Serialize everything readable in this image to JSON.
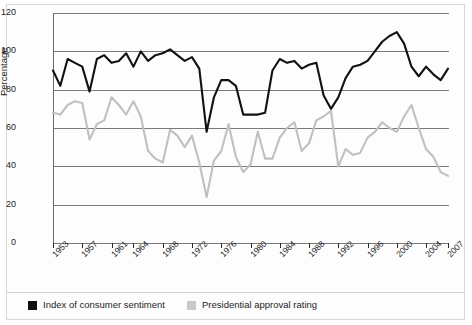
{
  "chart_data": {
    "type": "line",
    "title": "",
    "xlabel": "",
    "ylabel": "Percentage",
    "ylim": [
      0,
      120
    ],
    "ytick_step": 20,
    "ytick_labels": [
      "0",
      "20",
      "40",
      "60",
      "80",
      "100",
      "120"
    ],
    "grid": true,
    "legend_position": "bottom",
    "xtick_labels": [
      "1953",
      "1957",
      "1961",
      "1964",
      "1968",
      "1972",
      "1976",
      "1980",
      "1984",
      "1988",
      "1992",
      "1996",
      "2000",
      "2004",
      "2007"
    ],
    "x_range": [
      1953,
      2007
    ],
    "series": [
      {
        "name": "Index of consumer sentiment",
        "color": "#111111",
        "x": [
          1953,
          1954,
          1955,
          1956,
          1957,
          1958,
          1959,
          1960,
          1961,
          1962,
          1963,
          1964,
          1965,
          1966,
          1967,
          1968,
          1969,
          1970,
          1971,
          1972,
          1973,
          1974,
          1975,
          1976,
          1977,
          1978,
          1979,
          1980,
          1981,
          1982,
          1983,
          1984,
          1985,
          1986,
          1987,
          1988,
          1989,
          1990,
          1991,
          1992,
          1993,
          1994,
          1995,
          1996,
          1997,
          1998,
          1999,
          2000,
          2001,
          2002,
          2003,
          2004,
          2005,
          2006,
          2007
        ],
        "values": [
          90,
          82,
          96,
          94,
          92,
          79,
          96,
          98,
          94,
          95,
          99,
          92,
          100,
          95,
          98,
          99,
          101,
          98,
          95,
          97,
          91,
          58,
          76,
          85,
          85,
          82,
          67,
          67,
          67,
          68,
          90,
          96,
          94,
          95,
          91,
          93,
          94,
          77,
          70,
          76,
          86,
          92,
          93,
          95,
          100,
          105,
          108,
          110,
          104,
          92,
          87,
          92,
          88,
          85,
          91
        ]
      },
      {
        "name": "Presidential approval rating",
        "color": "#c9c9c9",
        "x": [
          1953,
          1954,
          1955,
          1956,
          1957,
          1958,
          1959,
          1960,
          1961,
          1962,
          1963,
          1964,
          1965,
          1966,
          1967,
          1968,
          1969,
          1970,
          1971,
          1972,
          1973,
          1974,
          1975,
          1976,
          1977,
          1978,
          1979,
          1980,
          1981,
          1982,
          1983,
          1984,
          1985,
          1986,
          1987,
          1988,
          1989,
          1990,
          1991,
          1992,
          1993,
          1994,
          1995,
          1996,
          1997,
          1998,
          1999,
          2000,
          2001,
          2002,
          2003,
          2004,
          2005,
          2006,
          2007
        ],
        "values": [
          68,
          67,
          72,
          74,
          73,
          54,
          62,
          64,
          76,
          72,
          67,
          74,
          66,
          48,
          44,
          42,
          59,
          56,
          50,
          56,
          42,
          24,
          43,
          48,
          62,
          45,
          37,
          41,
          58,
          44,
          44,
          55,
          60,
          63,
          48,
          52,
          64,
          66,
          69,
          40,
          49,
          46,
          47,
          55,
          58,
          63,
          60,
          58,
          66,
          72,
          60,
          49,
          45,
          37,
          35
        ]
      }
    ]
  },
  "axes": {
    "ylabel": "Percentage"
  },
  "legend": {
    "items": [
      {
        "label": "Index of consumer sentiment",
        "color": "#111111",
        "swatch": "black-square-swatch"
      },
      {
        "label": "Presidential approval rating",
        "color": "#c9c9c9",
        "swatch": "grey-square-swatch"
      }
    ]
  }
}
